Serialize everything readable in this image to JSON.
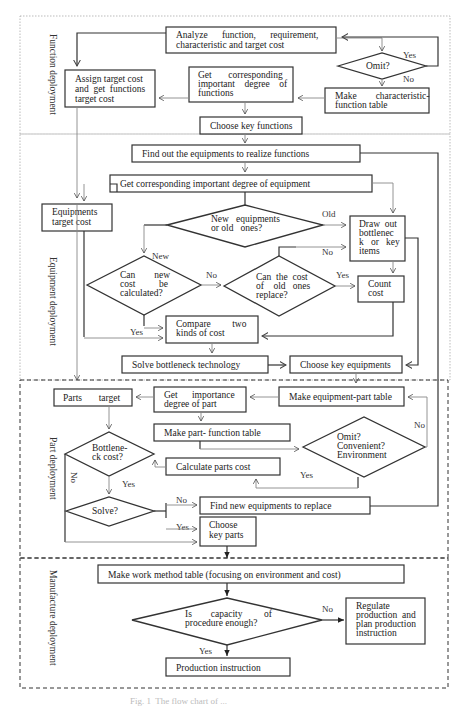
{
  "sections": {
    "function": "Function deployment",
    "equipment": "Equipment deployment",
    "part": "Part deployment",
    "manufacture": "Manufacture deployment"
  },
  "nodes": {
    "analyze": [
      "Analyze      function,      requirement,",
      "characteristic and target cost"
    ],
    "omit1": "Omit?",
    "assign_target": [
      "Assign target cost",
      "and  get  functions",
      "target cost"
    ],
    "get_func_degree": [
      "Get       corresponding",
      "important    degree    of",
      "functions"
    ],
    "make_char_table": [
      "Make        characteristic-",
      "function table"
    ],
    "choose_key_functions": "Choose key functions",
    "find_equipments": "Find out the equipments to realize functions",
    "get_equip_degree": "Get corresponding important degree of equipment",
    "equip_target": [
      "Equipments",
      "target cost"
    ],
    "new_or_old": [
      "New   equipments",
      "or old   ones?"
    ],
    "draw_bottleneck": [
      "Draw  out",
      "bottlenec",
      "k   or   key",
      "items"
    ],
    "can_new_cost": [
      "Can        new",
      "cost          be",
      "calculated?"
    ],
    "can_old_replace": [
      "Can  the  cost",
      "of    old   ones",
      "replace?"
    ],
    "count_cost": [
      "Count",
      "cost"
    ],
    "compare_costs": [
      "Compare         two",
      "kinds of cost"
    ],
    "solve_bottleneck": "Solve bottleneck technology",
    "choose_key_equipments": "Choose key equipments",
    "parts_target": "Parts       target",
    "get_part_degree": [
      "Get      importance",
      "degree of part"
    ],
    "make_equip_part_table": "Make equipment-part table",
    "make_part_func_table": "Make part- function table",
    "bottleneck_cost": [
      "Bottlene-",
      "ck cost?"
    ],
    "omit_conv_env": [
      "Omit?",
      "Convenient?",
      "Environment"
    ],
    "calc_parts_cost": "Calculate parts cost",
    "solve": "Solve?",
    "find_new_equipments": "Find new equipments to replace",
    "choose_key_parts": [
      "Choose",
      "key parts"
    ],
    "make_work_method": "Make work method table (focusing on environment and cost)",
    "capacity_enough": [
      "Is        capacity         of",
      "procedure enough?"
    ],
    "regulate": [
      "Regulate",
      "production  and",
      "plan production",
      "instruction"
    ],
    "production_instruction": "Production instruction"
  },
  "edge_labels": {
    "yes": "Yes",
    "no": "No",
    "new": "New",
    "old": "Old"
  },
  "caption": "Fig. 1  The flow chart of ..."
}
